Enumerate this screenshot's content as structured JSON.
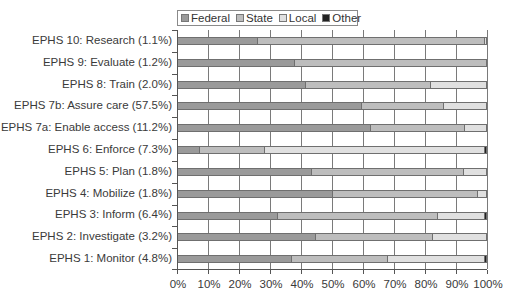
{
  "chart_data": {
    "type": "bar",
    "orientation": "horizontal",
    "stacked": "percent",
    "title": "",
    "xlabel": "",
    "ylabel": "",
    "xlim": [
      0,
      100
    ],
    "grid": true,
    "legend_position": "top",
    "x_ticks": [
      "0%",
      "10%",
      "20%",
      "30%",
      "40%",
      "50%",
      "60%",
      "70%",
      "80%",
      "90%",
      "100%"
    ],
    "categories": [
      "EPHS 10: Research (1.1%)",
      "EPHS 9: Evaluate (1.2%)",
      "EPHS 8: Train (2.0%)",
      "EPHS 7b: Assure care (57.5%)",
      "EPHS 7a: Enable access (11.2%)",
      "EPHS 6: Enforce (7.3%)",
      "EPHS 5: Plan (1.8%)",
      "EPHS 4: Mobilize (1.8%)",
      "EPHS 3: Inform (6.4%)",
      "EPHS 2: Investigate (3.2%)",
      "EPHS 1: Monitor (4.8%)"
    ],
    "series": [
      {
        "name": "Federal",
        "color": "#9a9a9a",
        "values": [
          26,
          38,
          41.5,
          59.5,
          62.5,
          7,
          43.5,
          50,
          32.5,
          44.5,
          37
        ]
      },
      {
        "name": "State",
        "color": "#bdbdbd",
        "values": [
          73.5,
          62,
          40.5,
          26.5,
          30.5,
          21,
          49,
          47,
          51.5,
          38,
          31
        ]
      },
      {
        "name": "Local",
        "color": "#e0e0e0",
        "values": [
          0.5,
          0,
          18,
          14,
          7,
          71.5,
          7.5,
          3,
          15.5,
          17.5,
          31.5
        ]
      },
      {
        "name": "Other",
        "color": "#222222",
        "values": [
          0,
          0,
          0,
          0,
          0,
          0.5,
          0,
          0,
          0.5,
          0,
          0.5
        ]
      }
    ]
  }
}
